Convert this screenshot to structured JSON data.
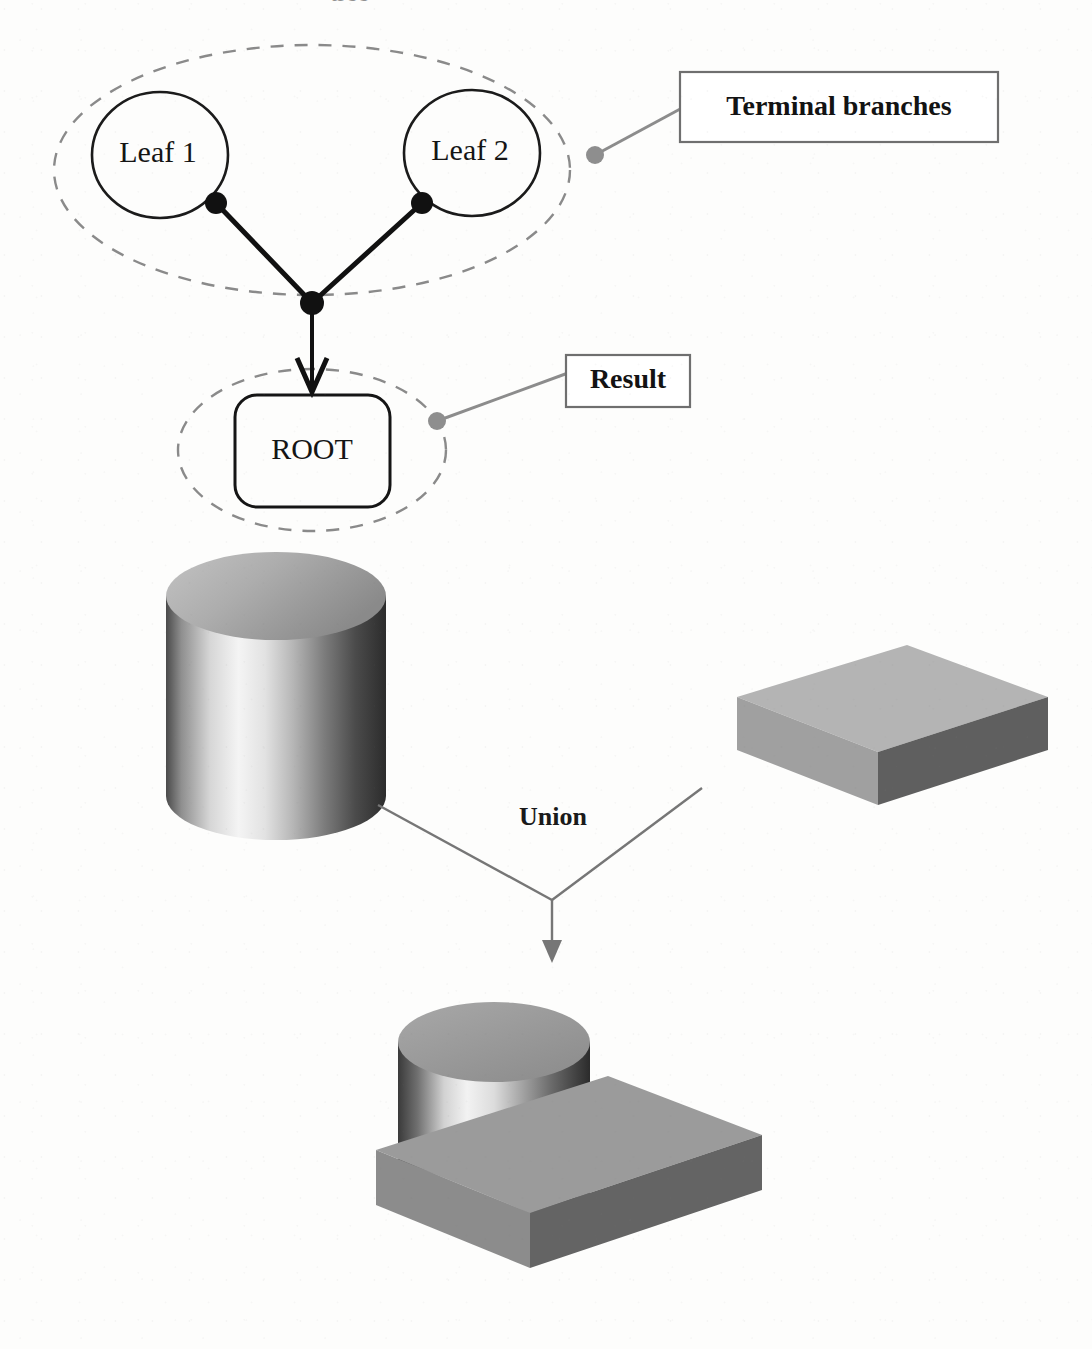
{
  "figure": {
    "background_color": "#fdfdfc",
    "cropped_top_text": "tree"
  },
  "tree": {
    "leaves": [
      {
        "id": "leaf-1",
        "label": "Leaf 1",
        "cx": 160,
        "cy": 155,
        "rx": 68,
        "ry": 63
      },
      {
        "id": "leaf-2",
        "label": "Leaf 2",
        "cx": 472,
        "cy": 153,
        "rx": 68,
        "ry": 63
      }
    ],
    "root": {
      "id": "root",
      "label": "ROOT",
      "x": 235,
      "y": 395,
      "width": 155,
      "height": 112,
      "corner_radius": 22
    },
    "nodes": [
      {
        "id": "leaf-1-port",
        "cx": 216,
        "cy": 203,
        "r": 11
      },
      {
        "id": "leaf-2-port",
        "cx": 422,
        "cy": 203,
        "r": 11
      },
      {
        "id": "junction",
        "cx": 312,
        "cy": 303,
        "r": 12
      }
    ],
    "edges": [
      {
        "from": "leaf-1-port",
        "to": "junction"
      },
      {
        "from": "leaf-2-port",
        "to": "junction"
      }
    ],
    "root_arrow": {
      "from_x": 312,
      "from_y": 312,
      "to_x": 312,
      "to_y": 393
    }
  },
  "grouping_ellipses": [
    {
      "id": "terminal-branches-group",
      "cx": 312,
      "cy": 170,
      "rx": 258,
      "ry": 125
    },
    {
      "id": "result-group",
      "cx": 312,
      "cy": 450,
      "rx": 134,
      "ry": 81
    }
  ],
  "callouts": [
    {
      "id": "terminal-branches",
      "label": "Terminal branches",
      "box": {
        "x": 680,
        "y": 72,
        "width": 318,
        "height": 70
      },
      "dot": {
        "cx": 595,
        "cy": 155,
        "r": 9
      },
      "leader": {
        "x1": 595,
        "y1": 155,
        "x2": 680,
        "y2": 108
      }
    },
    {
      "id": "result",
      "label": "Result",
      "box": {
        "x": 566,
        "y": 355,
        "width": 124,
        "height": 52
      },
      "dot": {
        "cx": 437,
        "cy": 421,
        "r": 9
      },
      "leader": {
        "x1": 437,
        "y1": 421,
        "x2": 566,
        "y2": 373
      }
    }
  ],
  "operation": {
    "id": "union-operation",
    "label": "Union",
    "label_x": 553,
    "label_y": 819,
    "left_leader": {
      "x1": 378,
      "y1": 805,
      "x2": 552,
      "y2": 900
    },
    "right_leader": {
      "x1": 702,
      "y1": 788,
      "x2": 552,
      "y2": 900
    },
    "arrow": {
      "x1": 552,
      "y1": 900,
      "x2": 552,
      "y2": 958
    }
  },
  "solids": [
    {
      "id": "operand-cylinder",
      "name": "cylinder",
      "shape": "cylinder",
      "cx": 276,
      "top_cy": 596,
      "rx": 110,
      "ry": 44,
      "height": 200,
      "top_fill_from": "#b9b9b9",
      "top_fill_to": "#8e8e8e",
      "side_highlight": "#f4f4f4",
      "side_shadow": "#2e2e2e"
    },
    {
      "id": "operand-box",
      "name": "rectangular block",
      "shape": "box",
      "top_fill": "#b2b2b2",
      "left_fill": "#9e9e9e",
      "front_fill": "#5e5e5e",
      "top_face": [
        [
          737,
          697
        ],
        [
          907,
          645
        ],
        [
          1048,
          697
        ],
        [
          878,
          752
        ]
      ],
      "left_face": [
        [
          737,
          697
        ],
        [
          878,
          752
        ],
        [
          878,
          802
        ],
        [
          737,
          747
        ]
      ],
      "front_face": [
        [
          878,
          752
        ],
        [
          1048,
          697
        ],
        [
          1048,
          747
        ],
        [
          878,
          802
        ]
      ]
    },
    {
      "id": "result-solid",
      "name": "union of cylinder and block",
      "shape": "csg-union",
      "cylinder": {
        "cx": 494,
        "top_cy": 1042,
        "rx": 96,
        "ry": 40,
        "height": 135
      },
      "block_top_fill": "#9a9a9a",
      "block_left_fill": "#8b8b8b",
      "block_front_fill": "#636363",
      "cyl_top_fill": "#9a9a9a",
      "cyl_side_highlight": "#f2f2f2",
      "cyl_side_shadow": "#2b2b2b"
    }
  ],
  "colors": {
    "ink": "#151515",
    "gray_leader": "#8c8c8c",
    "dashed_ellipse": "#8a8a8a",
    "callout_border": "#6f6f6f",
    "paper": "#fdfdfc"
  }
}
